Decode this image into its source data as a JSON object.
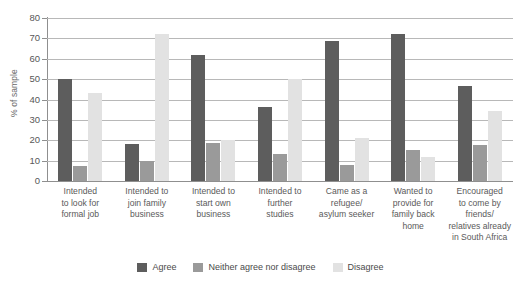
{
  "chart_data": {
    "type": "bar",
    "title": "",
    "subtitle": "",
    "xlabel": "",
    "ylabel": "% of sample",
    "ylim": [
      0,
      80
    ],
    "ytick_step": 10,
    "yticks": [
      "0",
      "10",
      "20",
      "30",
      "40",
      "50",
      "60",
      "70",
      "80"
    ],
    "grid": true,
    "legend_position": "bottom-center",
    "categories": [
      "Intended to look for formal job",
      "Intended to join family business",
      "Intended to start own business",
      "Intended to further studies",
      "Came as a refugee/ asylum seeker",
      "Wanted to provide for family back home",
      "Encouraged to come by friends/ relatives already in South Africa"
    ],
    "category_lines": [
      [
        "Intended",
        "to look for",
        "formal job"
      ],
      [
        "Intended to",
        "join family",
        "business"
      ],
      [
        "Intended to",
        "start own",
        "business"
      ],
      [
        "Intended to",
        "further",
        "studies"
      ],
      [
        "Came as a",
        "refugee/",
        "asylum seeker"
      ],
      [
        "Wanted to",
        "provide for",
        "family back",
        "home"
      ],
      [
        "Encouraged",
        "to come by",
        "friends/",
        "relatives already",
        "in South Africa"
      ]
    ],
    "series": [
      {
        "name": "Agree",
        "color": "#5d5d5d",
        "values": [
          50,
          18,
          62,
          36.5,
          68.5,
          72,
          46.5
        ]
      },
      {
        "name": "Neither agree nor disagree",
        "color": "#9a9a9a",
        "values": [
          7.5,
          10,
          18.5,
          13.5,
          8,
          15,
          17.5
        ]
      },
      {
        "name": "Disagree",
        "color": "#e2e2e2",
        "values": [
          43,
          72,
          20,
          50,
          21,
          12,
          34.5
        ]
      }
    ]
  },
  "axis": {
    "y_title": "% of sample"
  },
  "legend": {
    "items": [
      {
        "label": "Agree",
        "swatch": "agree"
      },
      {
        "label": "Neither agree nor disagree",
        "swatch": "neither"
      },
      {
        "label": "Disagree",
        "swatch": "disagree"
      }
    ]
  }
}
